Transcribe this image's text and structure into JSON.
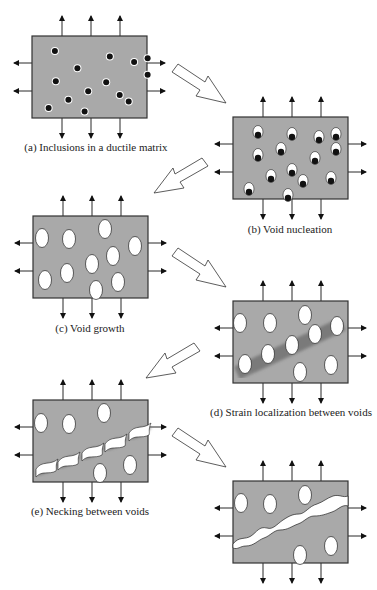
{
  "colors": {
    "matrix": "#a9a9a9",
    "border": "#333333",
    "inclusion": "#111111",
    "void": "#ffffff",
    "band": "#6e6e6e"
  },
  "stages": [
    {
      "id": "a",
      "caption": "(a) Inclusions in a ductile matrix"
    },
    {
      "id": "b",
      "caption": "(b) Void nucleation"
    },
    {
      "id": "c",
      "caption": "(c) Void growth"
    },
    {
      "id": "d",
      "caption": "(d) Strain localization between voids"
    },
    {
      "id": "e",
      "caption": "(e) Necking between voids"
    },
    {
      "id": "f",
      "caption": ""
    }
  ]
}
